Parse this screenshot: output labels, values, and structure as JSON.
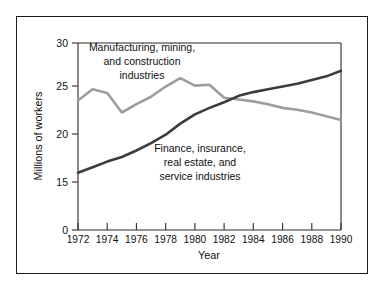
{
  "figure": {
    "background_color": "#ffffff",
    "border_color": "#1a1a1a"
  },
  "chart_data": {
    "type": "line",
    "title": "",
    "xlabel": "Year",
    "ylabel": "Millions of workers",
    "xlim": [
      1972,
      1990
    ],
    "ylim": [
      15,
      30
    ],
    "y_axis_break": true,
    "y_zero_shown": true,
    "grid": false,
    "legend_position": "inline-annotations",
    "xticks": [
      1972,
      1974,
      1976,
      1978,
      1980,
      1982,
      1984,
      1986,
      1988,
      1990
    ],
    "xtick_labels": [
      "1972",
      "1974",
      "1976",
      "1978",
      "1980",
      "1982",
      "1984",
      "1986",
      "1988",
      "1990"
    ],
    "yticks": [
      0,
      15,
      20,
      25,
      30
    ],
    "ytick_labels": [
      "0",
      "15",
      "20",
      "25",
      "30"
    ],
    "x": [
      1972,
      1973,
      1974,
      1975,
      1976,
      1977,
      1978,
      1979,
      1980,
      1981,
      1982,
      1983,
      1984,
      1985,
      1986,
      1987,
      1988,
      1989,
      1990
    ],
    "series": [
      {
        "name": "Manufacturing, mining, and construction industries",
        "color": "#9d9d9d",
        "values": [
          23.8,
          25.0,
          24.6,
          22.5,
          23.4,
          24.2,
          25.3,
          26.2,
          25.4,
          25.5,
          24.1,
          23.9,
          23.7,
          23.4,
          23.0,
          22.8,
          22.5,
          22.1,
          21.7
        ]
      },
      {
        "name": "Finance, insurance, real estate, and service industries",
        "color": "#3c3c3c",
        "values": [
          16.0,
          16.6,
          17.2,
          17.7,
          18.4,
          19.2,
          20.1,
          21.3,
          22.3,
          23.0,
          23.6,
          24.3,
          24.7,
          25.0,
          25.3,
          25.6,
          26.0,
          26.4,
          27.0
        ]
      }
    ],
    "annotations": [
      {
        "id": "label-manufacturing",
        "lines": [
          "Manufacturing, mining,",
          "and construction",
          "industries"
        ],
        "color": "#101010"
      },
      {
        "id": "label-finance",
        "lines": [
          "Finance, insurance,",
          "real estate, and",
          "service industries"
        ],
        "color": "#101010"
      }
    ]
  }
}
